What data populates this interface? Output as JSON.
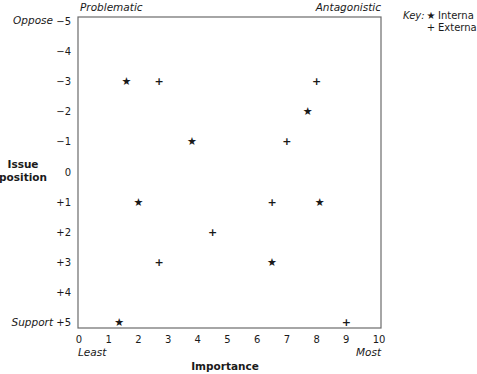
{
  "chart_data": {
    "type": "scatter",
    "title": "",
    "xlabel": "Importance",
    "ylabel": "Issue position",
    "ylabel_lines": [
      "Issue",
      "position"
    ],
    "xlim": [
      0,
      10
    ],
    "ylim": [
      -5,
      5
    ],
    "y_inverted": true,
    "grid": false,
    "x_ticks": [
      0,
      1,
      2,
      3,
      4,
      5,
      6,
      7,
      8,
      9,
      10
    ],
    "x_tick_labels": [
      "0",
      "1",
      "2",
      "3",
      "4",
      "5",
      "6",
      "7",
      "8",
      "9",
      "10"
    ],
    "y_ticks": [
      -5,
      -4,
      -3,
      -2,
      -1,
      0,
      1,
      2,
      3,
      4,
      5
    ],
    "y_tick_labels": [
      "−5",
      "−4",
      "−3",
      "−2",
      "−1",
      "0",
      "+1",
      "+2",
      "+3",
      "+4",
      "+5"
    ],
    "x_end_labels": {
      "low": "Least",
      "high": "Most"
    },
    "y_end_labels": {
      "low": "Oppose",
      "high": "Support"
    },
    "corner_labels": {
      "top_left": "Problematic",
      "top_right": "Antagonistic"
    },
    "legend": {
      "placement": "top-right-outside",
      "title": "Key:",
      "entries": [
        {
          "name": "Interna",
          "symbol": "★",
          "series": "internal"
        },
        {
          "name": "Externa",
          "symbol": "+",
          "series": "external"
        }
      ]
    },
    "series": [
      {
        "name": "Internal",
        "symbol": "★",
        "points": [
          {
            "x": 1.6,
            "y": -3
          },
          {
            "x": 7.7,
            "y": -2
          },
          {
            "x": 3.8,
            "y": -1
          },
          {
            "x": 2.0,
            "y": 1
          },
          {
            "x": 8.1,
            "y": 1
          },
          {
            "x": 6.5,
            "y": 3
          },
          {
            "x": 1.35,
            "y": 5
          }
        ]
      },
      {
        "name": "External",
        "symbol": "+",
        "points": [
          {
            "x": 2.7,
            "y": -3
          },
          {
            "x": 8.0,
            "y": -3
          },
          {
            "x": 7.0,
            "y": -1
          },
          {
            "x": 6.5,
            "y": 1
          },
          {
            "x": 4.5,
            "y": 2
          },
          {
            "x": 2.7,
            "y": 3
          },
          {
            "x": 9.0,
            "y": 5
          }
        ]
      }
    ]
  }
}
